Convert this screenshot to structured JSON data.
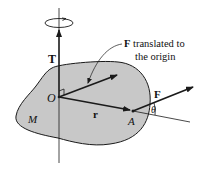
{
  "diagram": {
    "labels": {
      "torque": "T",
      "origin": "O",
      "body": "M",
      "position_vector": "r",
      "point": "A",
      "force": "F",
      "angle": "θ",
      "translated_force_bold": "F",
      "translated_force_line1": " translated to",
      "translated_force_line2": "the origin"
    },
    "colors": {
      "body_fill": "#c8c8c8",
      "stroke": "#1a1a1a"
    }
  }
}
